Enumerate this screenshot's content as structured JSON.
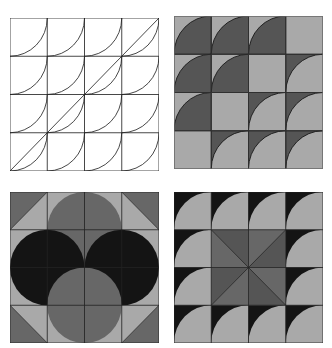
{
  "figure": {
    "colors": {
      "white": "#ffffff",
      "line": "#222222",
      "light": "#a9a9a9",
      "mid": "#676767",
      "dark": "#555555",
      "black": "#141414"
    },
    "panels": [
      {
        "id": "top-left",
        "style": "line-art",
        "grid": [
          4,
          4
        ],
        "tile": "quarter-arc centered at top-left corner",
        "extra": "diagonal line from bottom-left to top-right"
      },
      {
        "id": "top-right",
        "style": "two-tone",
        "grid": [
          4,
          4
        ],
        "rows": [
          [
            "D",
            "D",
            "D",
            "P"
          ],
          [
            "D",
            "D",
            "P",
            "I"
          ],
          [
            "D",
            "P",
            "I",
            "I"
          ],
          [
            "P",
            "I",
            "I",
            "I"
          ]
        ],
        "legend": {
          "D": "dark quarter circle on light",
          "I": "light quarter circle on dark",
          "P": "plain light"
        }
      },
      {
        "id": "bottom-left",
        "style": "circles",
        "grid": [
          4,
          4
        ],
        "tile": "corner triangles with overlapping circles forming pinwheel"
      },
      {
        "id": "bottom-right",
        "style": "border-and-pinwheel",
        "grid": [
          4,
          4
        ],
        "tile": "black border quarter-circle tiles with 8-triangle pinwheel center"
      }
    ]
  }
}
